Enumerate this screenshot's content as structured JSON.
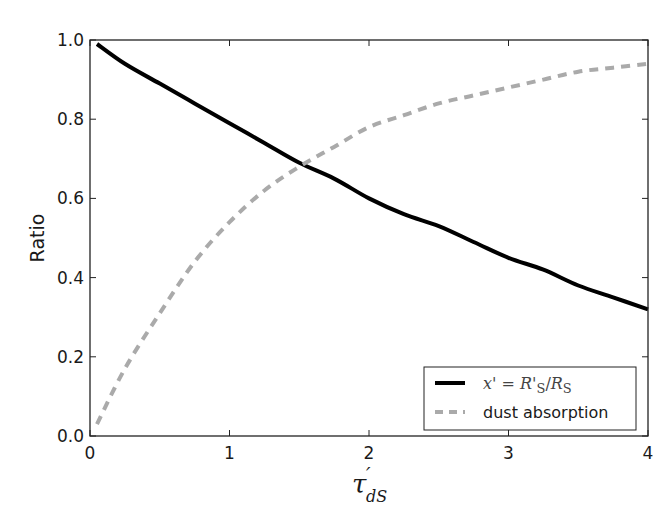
{
  "chart_data": {
    "type": "line",
    "title": "",
    "xlabel": "τ'_dS",
    "ylabel": "Ratio",
    "xlim": [
      0,
      4
    ],
    "ylim": [
      0.0,
      1.0
    ],
    "xticks": [
      0,
      1,
      2,
      3,
      4
    ],
    "xtick_labels": [
      "0",
      "1",
      "2",
      "3",
      "4"
    ],
    "yticks": [
      0.0,
      0.2,
      0.4,
      0.6,
      0.8,
      1.0
    ],
    "ytick_labels": [
      "0.0",
      "0.2",
      "0.4",
      "0.6",
      "0.8",
      "1.0"
    ],
    "grid": false,
    "legend_position": "lower right",
    "x": [
      0.05,
      0.25,
      0.5,
      0.75,
      1.0,
      1.25,
      1.5,
      1.75,
      2.0,
      2.25,
      2.5,
      2.75,
      3.0,
      3.25,
      3.5,
      3.75,
      4.0
    ],
    "series": [
      {
        "name": "x' = R'_S / R_S",
        "style": "solid",
        "color": "#000000",
        "values": [
          0.99,
          0.94,
          0.89,
          0.84,
          0.79,
          0.74,
          0.69,
          0.65,
          0.6,
          0.56,
          0.53,
          0.49,
          0.45,
          0.42,
          0.38,
          0.35,
          0.32
        ]
      },
      {
        "name": "dust absorption",
        "style": "dashed",
        "color": "#aaaaaa",
        "values": [
          0.03,
          0.17,
          0.31,
          0.44,
          0.54,
          0.62,
          0.68,
          0.73,
          0.78,
          0.81,
          0.84,
          0.86,
          0.88,
          0.9,
          0.92,
          0.93,
          0.94
        ]
      }
    ]
  },
  "legend": {
    "items": [
      {
        "label_math_parts": [
          "x",
          "' = ",
          "R",
          "'",
          "S",
          "/",
          "R",
          "S"
        ],
        "label": "x' = R'S/RS"
      },
      {
        "label": "dust absorption"
      }
    ]
  },
  "axes": {
    "ylabel": "Ratio",
    "xlabel_main": "τ",
    "xlabel_prime": "′",
    "xlabel_sub": "dS"
  }
}
